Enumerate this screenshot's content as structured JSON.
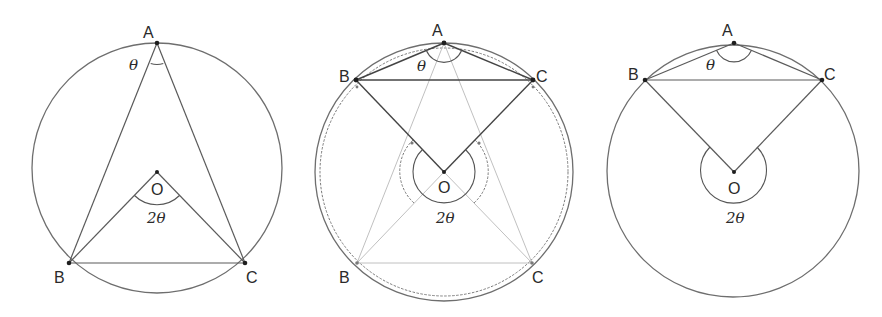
{
  "figure": {
    "panels": [
      {
        "name": "acute-inscribed-angle",
        "labels": {
          "A": "A",
          "B": "B",
          "C": "C",
          "O": "O",
          "inscribed_angle": "θ",
          "central_angle": "2θ"
        }
      },
      {
        "name": "obtuse-inscribed-angle-transition",
        "labels": {
          "A": "A",
          "B_top": "B",
          "C_top": "C",
          "B_bottom": "B",
          "C_bottom": "C",
          "O": "O",
          "inscribed_angle": "θ",
          "central_angle": "2θ"
        }
      },
      {
        "name": "obtuse-inscribed-angle-reflex-central",
        "labels": {
          "A": "A",
          "B": "B",
          "C": "C",
          "O": "O",
          "inscribed_angle": "θ",
          "central_angle": "2θ"
        }
      }
    ]
  },
  "colors": {
    "stroke": "#5a5a5a",
    "faint_stroke": "#b9b9b9",
    "text": "#2a2a2a",
    "background": "#ffffff"
  }
}
